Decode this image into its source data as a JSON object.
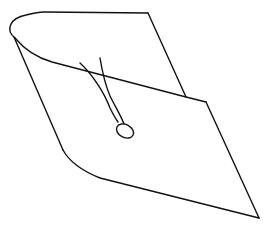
{
  "drawing": {
    "subject": "graduation-cap",
    "style": "line-sketch",
    "colors": {
      "background": "#ffffff",
      "stroke": "#111111"
    },
    "parts": [
      "cap-top-board",
      "cap-side-band",
      "tassel-strands",
      "tassel-knot"
    ]
  }
}
